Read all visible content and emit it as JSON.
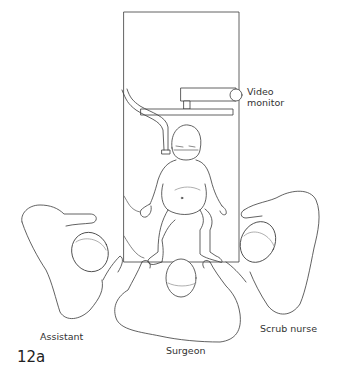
{
  "figure": {
    "label": "12a",
    "type": "operating room setup illustration"
  },
  "labels": {
    "video_monitor_line1": "Video",
    "video_monitor_line2": "monitor",
    "assistant": "Assistant",
    "surgeon": "Surgeon",
    "scrub_nurse": "Scrub nurse"
  },
  "colors": {
    "line": "#3a3a3a",
    "faint": "#9a9a9a",
    "background": "#ffffff"
  }
}
